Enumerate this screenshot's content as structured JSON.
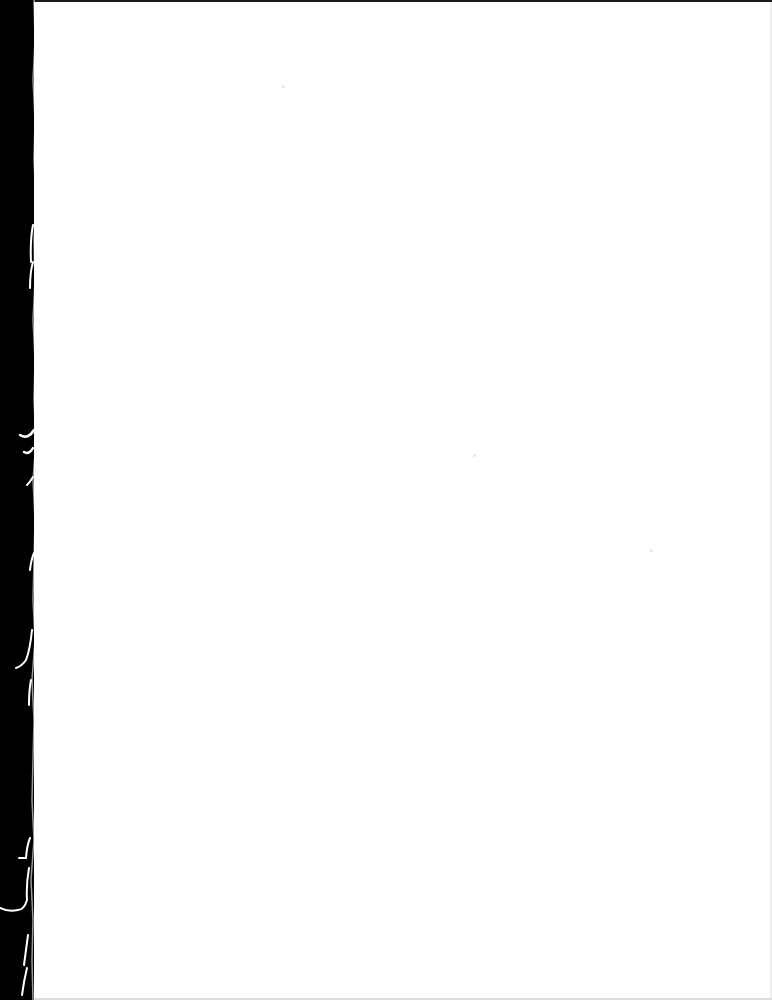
{
  "document": {
    "type": "scanned-page",
    "content_text": "",
    "colors": {
      "paper": "#ffffff",
      "scanner_background": "#000000",
      "top_edge_line": "#1a1a1a"
    }
  }
}
